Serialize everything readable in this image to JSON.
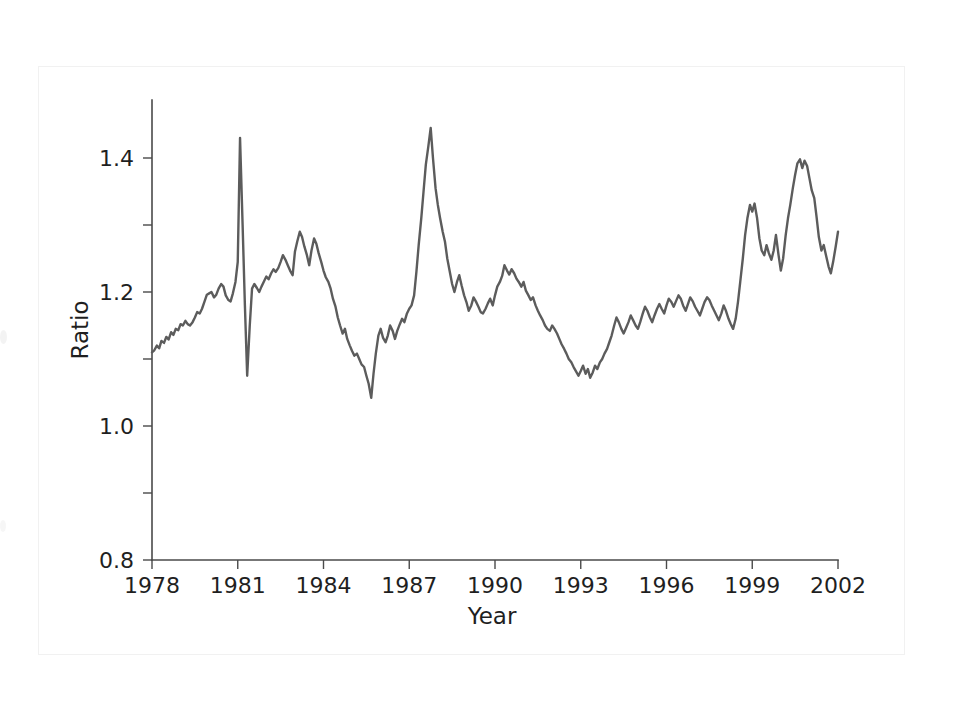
{
  "figure": {
    "background_color": "#ffffff",
    "frame_color": "#f1f1f1",
    "line_color": "#5c5c5c",
    "axis_color": "#4a4a4a",
    "text_color": "#1f1f1f"
  },
  "chart_data": {
    "type": "line",
    "title": "",
    "xlabel": "Year",
    "ylabel": "Ratio",
    "xlim": [
      1978,
      2002
    ],
    "ylim": [
      0.8,
      1.45
    ],
    "grid": false,
    "legend": null,
    "y_tick_labels": [
      "0.8",
      "1.0",
      "1.2",
      "1.4"
    ],
    "y_ticks": [
      0.8,
      1.0,
      1.2,
      1.4
    ],
    "y_minor_ticks": [
      0.9,
      1.1,
      1.3
    ],
    "x_tick_labels": [
      "1978",
      "1981",
      "1984",
      "1987",
      "1990",
      "1993",
      "1996",
      "1999",
      "2002"
    ],
    "x_ticks": [
      1978,
      1981,
      1984,
      1987,
      1990,
      1993,
      1996,
      1999,
      2002
    ],
    "series": [
      {
        "name": "Ratio",
        "color": "#5c5c5c",
        "x": [
          1978.0,
          1978.08,
          1978.17,
          1978.25,
          1978.33,
          1978.42,
          1978.5,
          1978.58,
          1978.67,
          1978.75,
          1978.83,
          1978.92,
          1979.0,
          1979.08,
          1979.17,
          1979.25,
          1979.33,
          1979.42,
          1979.5,
          1979.58,
          1979.67,
          1979.75,
          1979.83,
          1979.92,
          1980.0,
          1980.08,
          1980.17,
          1980.25,
          1980.33,
          1980.42,
          1980.5,
          1980.58,
          1980.67,
          1980.75,
          1980.83,
          1980.92,
          1981.0,
          1981.08,
          1981.17,
          1981.25,
          1981.33,
          1981.42,
          1981.5,
          1981.58,
          1981.67,
          1981.75,
          1981.83,
          1981.92,
          1982.0,
          1982.08,
          1982.17,
          1982.25,
          1982.33,
          1982.42,
          1982.5,
          1982.58,
          1982.67,
          1982.75,
          1982.83,
          1982.92,
          1983.0,
          1983.08,
          1983.17,
          1983.25,
          1983.33,
          1983.42,
          1983.5,
          1983.58,
          1983.67,
          1983.75,
          1983.83,
          1983.92,
          1984.0,
          1984.08,
          1984.17,
          1984.25,
          1984.33,
          1984.42,
          1984.5,
          1984.58,
          1984.67,
          1984.75,
          1984.83,
          1984.92,
          1985.0,
          1985.08,
          1985.17,
          1985.25,
          1985.33,
          1985.42,
          1985.5,
          1985.58,
          1985.67,
          1985.75,
          1985.83,
          1985.92,
          1986.0,
          1986.08,
          1986.17,
          1986.25,
          1986.33,
          1986.42,
          1986.5,
          1986.58,
          1986.67,
          1986.75,
          1986.83,
          1986.92,
          1987.0,
          1987.08,
          1987.17,
          1987.25,
          1987.33,
          1987.42,
          1987.5,
          1987.58,
          1987.67,
          1987.75,
          1987.83,
          1987.92,
          1988.0,
          1988.08,
          1988.17,
          1988.25,
          1988.33,
          1988.42,
          1988.5,
          1988.58,
          1988.67,
          1988.75,
          1988.83,
          1988.92,
          1989.0,
          1989.08,
          1989.17,
          1989.25,
          1989.33,
          1989.42,
          1989.5,
          1989.58,
          1989.67,
          1989.75,
          1989.83,
          1989.92,
          1990.0,
          1990.08,
          1990.17,
          1990.25,
          1990.33,
          1990.42,
          1990.5,
          1990.58,
          1990.67,
          1990.75,
          1990.83,
          1990.92,
          1991.0,
          1991.08,
          1991.17,
          1991.25,
          1991.33,
          1991.42,
          1991.5,
          1991.58,
          1991.67,
          1991.75,
          1991.83,
          1991.92,
          1992.0,
          1992.08,
          1992.17,
          1992.25,
          1992.33,
          1992.42,
          1992.5,
          1992.58,
          1992.67,
          1992.75,
          1992.83,
          1992.92,
          1993.0,
          1993.08,
          1993.17,
          1993.25,
          1993.33,
          1993.42,
          1993.5,
          1993.58,
          1993.67,
          1993.75,
          1993.83,
          1993.92,
          1994.0,
          1994.08,
          1994.17,
          1994.25,
          1994.33,
          1994.42,
          1994.5,
          1994.58,
          1994.67,
          1994.75,
          1994.83,
          1994.92,
          1995.0,
          1995.08,
          1995.17,
          1995.25,
          1995.33,
          1995.42,
          1995.5,
          1995.58,
          1995.67,
          1995.75,
          1995.83,
          1995.92,
          1996.0,
          1996.08,
          1996.17,
          1996.25,
          1996.33,
          1996.42,
          1996.5,
          1996.58,
          1996.67,
          1996.75,
          1996.83,
          1996.92,
          1997.0,
          1997.08,
          1997.17,
          1997.25,
          1997.33,
          1997.42,
          1997.5,
          1997.58,
          1997.67,
          1997.75,
          1997.83,
          1997.92,
          1998.0,
          1998.08,
          1998.17,
          1998.25,
          1998.33,
          1998.42,
          1998.5,
          1998.58,
          1998.67,
          1998.75,
          1998.83,
          1998.92,
          1999.0,
          1999.08,
          1999.17,
          1999.25,
          1999.33,
          1999.42,
          1999.5,
          1999.58,
          1999.67,
          1999.75,
          1999.83,
          1999.92,
          2000.0,
          2000.08,
          2000.17,
          2000.25,
          2000.33,
          2000.42,
          2000.5,
          2000.58,
          2000.67,
          2000.75,
          2000.83,
          2000.92,
          2001.0,
          2001.08,
          2001.17,
          2001.25,
          2001.33,
          2001.42,
          2001.5,
          2001.58,
          2001.67,
          2001.75,
          2001.83,
          2001.92,
          2002.0
        ],
        "values": [
          1.11,
          1.113,
          1.12,
          1.116,
          1.127,
          1.124,
          1.133,
          1.129,
          1.14,
          1.136,
          1.145,
          1.143,
          1.152,
          1.15,
          1.157,
          1.152,
          1.15,
          1.155,
          1.162,
          1.17,
          1.168,
          1.175,
          1.185,
          1.196,
          1.198,
          1.2,
          1.192,
          1.196,
          1.205,
          1.212,
          1.208,
          1.195,
          1.188,
          1.186,
          1.198,
          1.215,
          1.245,
          1.43,
          1.3,
          1.18,
          1.075,
          1.15,
          1.205,
          1.212,
          1.206,
          1.2,
          1.208,
          1.216,
          1.223,
          1.219,
          1.228,
          1.234,
          1.23,
          1.236,
          1.245,
          1.255,
          1.248,
          1.24,
          1.232,
          1.225,
          1.26,
          1.275,
          1.29,
          1.282,
          1.268,
          1.255,
          1.24,
          1.262,
          1.28,
          1.272,
          1.258,
          1.245,
          1.232,
          1.222,
          1.215,
          1.205,
          1.19,
          1.178,
          1.162,
          1.15,
          1.138,
          1.145,
          1.13,
          1.12,
          1.112,
          1.105,
          1.108,
          1.1,
          1.092,
          1.088,
          1.075,
          1.063,
          1.042,
          1.078,
          1.108,
          1.135,
          1.145,
          1.132,
          1.125,
          1.135,
          1.15,
          1.142,
          1.13,
          1.142,
          1.152,
          1.16,
          1.155,
          1.168,
          1.175,
          1.18,
          1.195,
          1.23,
          1.27,
          1.31,
          1.35,
          1.39,
          1.418,
          1.445,
          1.4,
          1.355,
          1.33,
          1.31,
          1.29,
          1.275,
          1.25,
          1.23,
          1.212,
          1.2,
          1.215,
          1.225,
          1.21,
          1.195,
          1.185,
          1.172,
          1.18,
          1.192,
          1.186,
          1.178,
          1.17,
          1.168,
          1.175,
          1.183,
          1.19,
          1.18,
          1.195,
          1.208,
          1.215,
          1.224,
          1.24,
          1.232,
          1.226,
          1.234,
          1.228,
          1.22,
          1.215,
          1.208,
          1.215,
          1.202,
          1.195,
          1.188,
          1.192,
          1.18,
          1.172,
          1.165,
          1.158,
          1.15,
          1.145,
          1.142,
          1.15,
          1.145,
          1.138,
          1.13,
          1.122,
          1.115,
          1.108,
          1.1,
          1.095,
          1.088,
          1.082,
          1.075,
          1.082,
          1.09,
          1.078,
          1.085,
          1.072,
          1.08,
          1.09,
          1.085,
          1.095,
          1.1,
          1.108,
          1.115,
          1.125,
          1.135,
          1.15,
          1.162,
          1.155,
          1.145,
          1.138,
          1.146,
          1.155,
          1.165,
          1.158,
          1.15,
          1.145,
          1.155,
          1.168,
          1.178,
          1.172,
          1.162,
          1.155,
          1.165,
          1.175,
          1.182,
          1.175,
          1.168,
          1.18,
          1.19,
          1.185,
          1.178,
          1.186,
          1.195,
          1.19,
          1.18,
          1.172,
          1.182,
          1.192,
          1.186,
          1.178,
          1.172,
          1.165,
          1.175,
          1.185,
          1.192,
          1.188,
          1.18,
          1.172,
          1.165,
          1.158,
          1.168,
          1.18,
          1.172,
          1.16,
          1.152,
          1.145,
          1.16,
          1.185,
          1.215,
          1.25,
          1.285,
          1.31,
          1.33,
          1.32,
          1.332,
          1.31,
          1.28,
          1.262,
          1.255,
          1.27,
          1.258,
          1.248,
          1.262,
          1.285,
          1.255,
          1.232,
          1.25,
          1.285,
          1.31,
          1.33,
          1.355,
          1.375,
          1.392,
          1.398,
          1.385,
          1.396,
          1.388,
          1.37,
          1.352,
          1.34,
          1.312,
          1.282,
          1.262,
          1.27,
          1.255,
          1.238,
          1.228,
          1.245,
          1.268,
          1.29
        ]
      }
    ]
  },
  "labels": {
    "y_axis_title": "Ratio",
    "x_axis_title": "Year"
  }
}
